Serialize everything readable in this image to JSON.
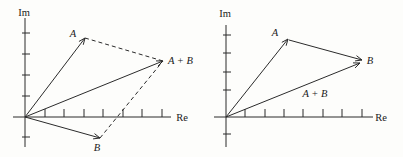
{
  "figure": {
    "background": "#fdfdfb",
    "line_color": "#2b2b2b",
    "text_color": "#1a1a1a"
  },
  "diagrams": [
    {
      "id": "parallelogram-method-diagram",
      "axes": {
        "im_label": "Im",
        "re_label": "Re",
        "origin": {
          "x": 25,
          "y": 117
        },
        "im_axis": {
          "x": 25,
          "top": 18,
          "bottom": 147,
          "label_x": 24,
          "label_y": 16
        },
        "re_axis": {
          "y": 117,
          "left": 13,
          "right": 171,
          "label_x": 182,
          "label_y": 121
        },
        "im_ticks": [
          33,
          54,
          75,
          96,
          137
        ],
        "re_ticks": [
          45,
          64,
          84,
          103,
          123,
          142,
          162
        ]
      },
      "vectors": [
        {
          "name": "vector-a",
          "label": "A",
          "from": [
            25,
            117
          ],
          "to": [
            85,
            38
          ],
          "label_x": 73,
          "label_y": 37,
          "label_anchor": "middle"
        },
        {
          "name": "vector-b",
          "label": "B",
          "from": [
            25,
            117
          ],
          "to": [
            100,
            138
          ],
          "label_x": 97,
          "label_y": 151,
          "label_anchor": "middle"
        },
        {
          "name": "vector-a-plus-b",
          "label": "A + B",
          "from": [
            25,
            117
          ],
          "to": [
            163,
            61
          ],
          "label_x": 168,
          "label_y": 64,
          "label_anchor": "start"
        }
      ],
      "dashed_lines": [
        {
          "name": "dashed-a-tip-to-sum",
          "from": [
            85,
            38
          ],
          "to": [
            163,
            61
          ]
        },
        {
          "name": "dashed-b-tip-to-sum",
          "from": [
            100,
            138
          ],
          "to": [
            163,
            61
          ]
        }
      ]
    },
    {
      "id": "head-to-tail-method-diagram",
      "axes": {
        "im_label": "Im",
        "re_label": "Re",
        "origin": {
          "x": 226,
          "y": 117
        },
        "im_axis": {
          "x": 226,
          "top": 25,
          "bottom": 147,
          "label_x": 225,
          "label_y": 17
        },
        "re_axis": {
          "y": 117,
          "left": 214,
          "right": 373,
          "label_x": 381,
          "label_y": 121
        },
        "im_ticks": [
          35,
          53,
          72,
          90,
          134
        ],
        "re_ticks": [
          245,
          265,
          284,
          303,
          323,
          342,
          362
        ]
      },
      "vectors": [
        {
          "name": "vector-a",
          "label": "A",
          "from": [
            226,
            117
          ],
          "to": [
            288,
            39
          ],
          "label_x": 275,
          "label_y": 36,
          "label_anchor": "middle"
        },
        {
          "name": "vector-b",
          "label": "B",
          "from": [
            289,
            40
          ],
          "to": [
            362,
            60
          ],
          "label_x": 370,
          "label_y": 64,
          "label_anchor": "middle"
        },
        {
          "name": "vector-a-plus-b",
          "label": "A + B",
          "from": [
            226,
            117
          ],
          "to": [
            360,
            63
          ],
          "label_x": 315,
          "label_y": 97,
          "label_anchor": "middle"
        }
      ],
      "dashed_lines": []
    }
  ]
}
